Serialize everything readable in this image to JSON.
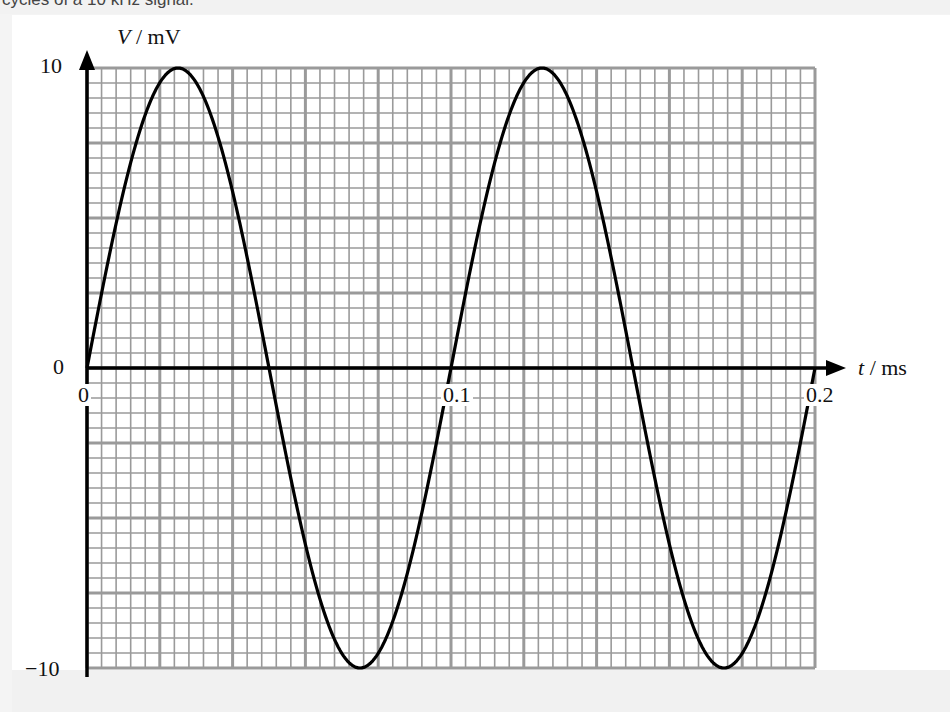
{
  "caption": "cycles of a 10 kHz signal.",
  "chart_data": {
    "type": "line",
    "title": "",
    "xlabel": "t / ms",
    "ylabel": "V / mV",
    "xlabel_var": "t",
    "xlabel_unit": "/ ms",
    "ylabel_var": "V",
    "ylabel_unit": "/ mV",
    "x_ticks": [
      "0",
      "0.1",
      "0.2"
    ],
    "y_ticks": [
      "10",
      "0",
      "−10"
    ],
    "xlim": [
      0,
      0.2
    ],
    "ylim": [
      -10,
      10
    ],
    "grid": true,
    "grid_major_x_step": 0.02,
    "grid_major_y_step": 2.5,
    "grid_minor_subdivisions": 5,
    "series": [
      {
        "name": "V(t) = 10 sin(2π · 10 kHz · t)",
        "amplitude_mV": 10,
        "frequency_kHz": 10,
        "period_ms": 0.1,
        "x": [
          0,
          0.025,
          0.05,
          0.075,
          0.1,
          0.125,
          0.15,
          0.175,
          0.2
        ],
        "y": [
          0,
          10,
          0,
          -10,
          0,
          10,
          0,
          -10,
          0
        ]
      }
    ],
    "legend": "none"
  },
  "colors": {
    "grid": "#9a9a9a",
    "axis": "#000000",
    "curve": "#000000"
  }
}
